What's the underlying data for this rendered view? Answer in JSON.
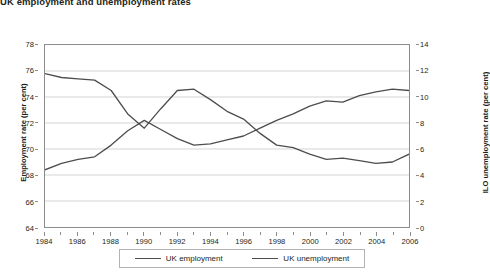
{
  "figure": {
    "title": "UK employment and unemployment rates"
  },
  "legend": {
    "position": "bottom",
    "items": [
      {
        "label": "UK employment",
        "color": "#4d4d4d"
      },
      {
        "label": "UK unemployment",
        "color": "#4d4d4d"
      }
    ]
  },
  "axes": {
    "x": {
      "label": "",
      "min": 1984,
      "max": 2006,
      "major_ticks": [
        1984,
        1986,
        1988,
        1990,
        1992,
        1994,
        1996,
        1998,
        2000,
        2002,
        2004,
        2006
      ],
      "minor_tick_interval": 1
    },
    "y_left": {
      "label": "Employment rate (per cent)",
      "min": 64,
      "max": 78,
      "ticks": [
        64,
        66,
        68,
        70,
        72,
        74,
        76,
        78
      ]
    },
    "y_right": {
      "label": "ILO unemployment rate (per cent)",
      "min": 0,
      "max": 14,
      "ticks": [
        0,
        2,
        4,
        6,
        8,
        10,
        12,
        14
      ]
    }
  },
  "chart_data": {
    "type": "line",
    "title": "UK employment and unemployment rates",
    "xlabel": "",
    "ylabel": "Employment rate (per cent)",
    "ylabel_secondary": "ILO unemployment rate (per cent)",
    "xlim": [
      1984,
      2006
    ],
    "ylim": [
      64,
      78
    ],
    "ylim_secondary": [
      0,
      14
    ],
    "grid": true,
    "legend_position": "bottom",
    "x": [
      1984,
      1985,
      1986,
      1987,
      1988,
      1989,
      1990,
      1991,
      1992,
      1993,
      1994,
      1995,
      1996,
      1997,
      1998,
      1999,
      2000,
      2001,
      2002,
      2003,
      2004,
      2005,
      2006
    ],
    "series": [
      {
        "name": "UK employment",
        "axis": "left",
        "units": "per cent",
        "color": "#4d4d4d",
        "values": [
          68.4,
          68.9,
          69.2,
          69.4,
          70.3,
          71.4,
          72.2,
          71.5,
          70.8,
          70.3,
          70.4,
          70.7,
          71.0,
          71.6,
          72.2,
          72.7,
          73.3,
          73.7,
          73.6,
          74.1,
          74.4,
          74.6,
          74.5
        ]
      },
      {
        "name": "UK unemployment",
        "axis": "right",
        "units": "per cent",
        "color": "#4d4d4d",
        "values": [
          11.8,
          11.5,
          11.4,
          11.3,
          10.5,
          8.7,
          7.6,
          9.1,
          10.5,
          10.6,
          9.8,
          8.9,
          8.3,
          7.2,
          6.3,
          6.1,
          5.6,
          5.2,
          5.3,
          5.1,
          4.9,
          5.0,
          5.6
        ]
      }
    ]
  }
}
